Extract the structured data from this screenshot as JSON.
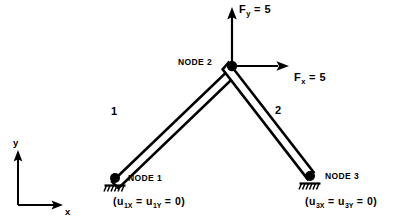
{
  "figure": {
    "type": "two-member-truss-finite-element-diagram",
    "background_color": "#ffffff",
    "line_color": "#000000"
  },
  "nodes": [
    {
      "id": "1",
      "label": "NODE 1",
      "x": 115,
      "y": 178,
      "support": "pin"
    },
    {
      "id": "2",
      "label": "NODE 2",
      "x": 232,
      "y": 66,
      "support": "none"
    },
    {
      "id": "3",
      "label": "NODE 3",
      "x": 310,
      "y": 176,
      "support": "pin"
    }
  ],
  "elements": [
    {
      "id": "1",
      "label": "1",
      "from": "1",
      "to": "2"
    },
    {
      "id": "2",
      "label": "2",
      "from": "2",
      "to": "3"
    }
  ],
  "forces": [
    {
      "name": "Fy",
      "symbol": "F",
      "subscript": "y",
      "equals": "=",
      "value": "5",
      "text": "F_y = 5",
      "direction": "up",
      "applied_at_node": "2"
    },
    {
      "name": "Fx",
      "symbol": "F",
      "subscript": "x",
      "equals": "=",
      "value": "5",
      "text": "F_x = 5",
      "direction": "right",
      "applied_at_node": "2"
    }
  ],
  "constraints": [
    {
      "node": "1",
      "text": "(u1x = u1y = 0)",
      "open_paren": "(u",
      "sub_a": "1X",
      "mid": " = u",
      "sub_b": "1Y",
      "close": " = 0)"
    },
    {
      "node": "3",
      "text": "(u3x = u3y = 0)",
      "open_paren": "(u",
      "sub_a": "3X",
      "mid": " = u",
      "sub_b": "3Y",
      "close": " = 0)"
    }
  ],
  "axes": {
    "x_label": "x",
    "y_label": "y",
    "origin_x": 18,
    "origin_y": 205
  }
}
